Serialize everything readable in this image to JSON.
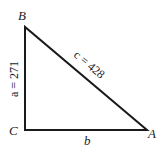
{
  "diagram": {
    "type": "right-triangle",
    "vertices": {
      "A": {
        "label": "A",
        "x": 147,
        "y": 130
      },
      "B": {
        "label": "B",
        "x": 25,
        "y": 27
      },
      "C": {
        "label": "C",
        "x": 25,
        "y": 130
      }
    },
    "sides": {
      "a": {
        "label": "a = 271",
        "var": "a",
        "value": "271"
      },
      "b": {
        "label": "b",
        "var": "b"
      },
      "c": {
        "label": "c = 428",
        "var": "c",
        "value": "428"
      }
    },
    "right_angle_at": "C",
    "line_color": "#1a1a1a"
  }
}
